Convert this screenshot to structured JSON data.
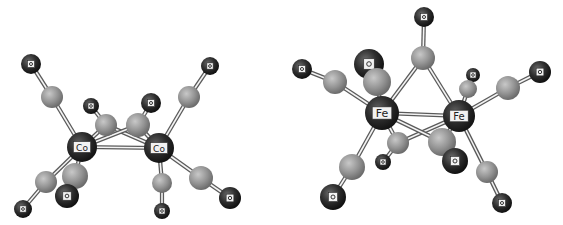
{
  "figure": {
    "molecules": [
      {
        "id": "left",
        "atoms": [
          {
            "id": "O1",
            "el": "O",
            "label": "O",
            "x": 31,
            "y": 64,
            "r": 10
          },
          {
            "id": "C1",
            "el": "C",
            "label": "",
            "x": 52,
            "y": 97,
            "r": 11
          },
          {
            "id": "O2",
            "el": "O",
            "label": "O",
            "x": 210,
            "y": 66,
            "r": 9
          },
          {
            "id": "C2",
            "el": "C",
            "label": "",
            "x": 189,
            "y": 97,
            "r": 11
          },
          {
            "id": "O3",
            "el": "O",
            "label": "O",
            "x": 91,
            "y": 106,
            "r": 8
          },
          {
            "id": "O4",
            "el": "O",
            "label": "O",
            "x": 151,
            "y": 103,
            "r": 10
          },
          {
            "id": "C3",
            "el": "C",
            "label": "",
            "x": 106,
            "y": 125,
            "r": 11
          },
          {
            "id": "C4",
            "el": "C",
            "label": "",
            "x": 138,
            "y": 125,
            "r": 12
          },
          {
            "id": "Co1",
            "el": "M",
            "label": "Co",
            "x": 82,
            "y": 147,
            "r": 15
          },
          {
            "id": "Co2",
            "el": "M",
            "label": "Co",
            "x": 159,
            "y": 148,
            "r": 15
          },
          {
            "id": "C5",
            "el": "C",
            "label": "",
            "x": 46,
            "y": 182,
            "r": 11
          },
          {
            "id": "O5",
            "el": "O",
            "label": "O",
            "x": 23,
            "y": 209,
            "r": 9
          },
          {
            "id": "C6",
            "el": "C",
            "label": "",
            "x": 75,
            "y": 176,
            "r": 13
          },
          {
            "id": "O6",
            "el": "O",
            "label": "O",
            "x": 67,
            "y": 196,
            "r": 12
          },
          {
            "id": "C7",
            "el": "C",
            "label": "",
            "x": 162,
            "y": 183,
            "r": 10
          },
          {
            "id": "O7",
            "el": "O",
            "label": "O",
            "x": 162,
            "y": 211,
            "r": 8
          },
          {
            "id": "C8",
            "el": "C",
            "label": "",
            "x": 201,
            "y": 178,
            "r": 12
          },
          {
            "id": "O8",
            "el": "O",
            "label": "O",
            "x": 230,
            "y": 198,
            "r": 11
          }
        ],
        "bonds": [
          [
            "O1",
            "C1"
          ],
          [
            "C1",
            "Co1"
          ],
          [
            "O2",
            "C2"
          ],
          [
            "C2",
            "Co2"
          ],
          [
            "O3",
            "C3"
          ],
          [
            "C3",
            "Co1"
          ],
          [
            "C3",
            "Co2"
          ],
          [
            "O4",
            "C4"
          ],
          [
            "C4",
            "Co1"
          ],
          [
            "C4",
            "Co2"
          ],
          [
            "Co1",
            "Co2"
          ],
          [
            "Co1",
            "C5"
          ],
          [
            "C5",
            "O5"
          ],
          [
            "Co1",
            "C6"
          ],
          [
            "C6",
            "O6"
          ],
          [
            "Co2",
            "C7"
          ],
          [
            "C7",
            "O7"
          ],
          [
            "Co2",
            "C8"
          ],
          [
            "C8",
            "O8"
          ]
        ],
        "draw_order": [
          "O1",
          "C1",
          "O2",
          "C2",
          "O3",
          "O4",
          "C3",
          "C4",
          "Co1",
          "Co2",
          "C5",
          "O5",
          "C7",
          "C8",
          "O8",
          "O7",
          "C6",
          "O6"
        ]
      },
      {
        "id": "right",
        "atoms": [
          {
            "id": "O10",
            "el": "O",
            "label": "O",
            "x": 424,
            "y": 17,
            "r": 10
          },
          {
            "id": "C10",
            "el": "C",
            "label": "",
            "x": 423,
            "y": 58,
            "r": 12
          },
          {
            "id": "O11",
            "el": "O",
            "label": "O",
            "x": 302,
            "y": 69,
            "r": 10
          },
          {
            "id": "C11",
            "el": "C",
            "label": "",
            "x": 335,
            "y": 82,
            "r": 12
          },
          {
            "id": "O12",
            "el": "O",
            "label": "O",
            "x": 369,
            "y": 64,
            "r": 15
          },
          {
            "id": "C12",
            "el": "C",
            "label": "",
            "x": 377,
            "y": 82,
            "r": 14
          },
          {
            "id": "Fe1",
            "el": "M",
            "label": "Fe",
            "x": 382,
            "y": 113,
            "r": 17
          },
          {
            "id": "Fe2",
            "el": "M",
            "label": "Fe",
            "x": 459,
            "y": 116,
            "r": 16
          },
          {
            "id": "O13",
            "el": "O",
            "label": "O",
            "x": 473,
            "y": 75,
            "r": 7
          },
          {
            "id": "C13",
            "el": "C",
            "label": "",
            "x": 468,
            "y": 89,
            "r": 9
          },
          {
            "id": "C14",
            "el": "C",
            "label": "",
            "x": 508,
            "y": 88,
            "r": 12
          },
          {
            "id": "O14",
            "el": "O",
            "label": "O",
            "x": 540,
            "y": 72,
            "r": 11
          },
          {
            "id": "C15",
            "el": "C",
            "label": "",
            "x": 398,
            "y": 143,
            "r": 11
          },
          {
            "id": "O15",
            "el": "O",
            "label": "O",
            "x": 383,
            "y": 162,
            "r": 8
          },
          {
            "id": "C16",
            "el": "C",
            "label": "",
            "x": 442,
            "y": 142,
            "r": 14
          },
          {
            "id": "O16",
            "el": "O",
            "label": "O",
            "x": 455,
            "y": 161,
            "r": 13
          },
          {
            "id": "C17",
            "el": "C",
            "label": "",
            "x": 352,
            "y": 167,
            "r": 13
          },
          {
            "id": "O17",
            "el": "O",
            "label": "O",
            "x": 333,
            "y": 197,
            "r": 13
          },
          {
            "id": "C18",
            "el": "C",
            "label": "",
            "x": 487,
            "y": 172,
            "r": 11
          },
          {
            "id": "O18",
            "el": "O",
            "label": "O",
            "x": 502,
            "y": 203,
            "r": 10
          }
        ],
        "bonds": [
          [
            "O10",
            "C10"
          ],
          [
            "C10",
            "Fe1"
          ],
          [
            "C10",
            "Fe2"
          ],
          [
            "O11",
            "C11"
          ],
          [
            "C11",
            "Fe1"
          ],
          [
            "O12",
            "C12"
          ],
          [
            "C12",
            "Fe1"
          ],
          [
            "Fe1",
            "Fe2"
          ],
          [
            "O13",
            "C13"
          ],
          [
            "C13",
            "Fe2"
          ],
          [
            "C14",
            "Fe2"
          ],
          [
            "C14",
            "O14"
          ],
          [
            "C15",
            "Fe1"
          ],
          [
            "C15",
            "Fe2"
          ],
          [
            "C15",
            "O15"
          ],
          [
            "C16",
            "Fe1"
          ],
          [
            "C16",
            "Fe2"
          ],
          [
            "C16",
            "O16"
          ],
          [
            "Fe1",
            "C17"
          ],
          [
            "C17",
            "O17"
          ],
          [
            "Fe2",
            "C18"
          ],
          [
            "C18",
            "O18"
          ]
        ],
        "draw_order": [
          "O10",
          "C10",
          "O11",
          "C11",
          "O13",
          "C13",
          "O14",
          "C14",
          "O12",
          "C12",
          "Fe1",
          "Fe2",
          "O15",
          "C15",
          "C17",
          "O17",
          "C18",
          "O18",
          "C16",
          "O16"
        ]
      }
    ],
    "colors": {
      "oxygen": "#262626",
      "carbon": "#8e8e8e",
      "metal": "#2c2c2c",
      "bond": "#5a5a5a",
      "label_box": "#f2f2f2"
    }
  }
}
